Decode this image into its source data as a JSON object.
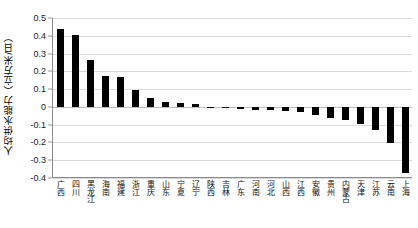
{
  "chart_data": {
    "type": "bar",
    "title": "",
    "subtitle": "",
    "xlabel": "",
    "ylabel": "人均供水能力（立方米/日）",
    "ylim": [
      -0.4,
      0.5
    ],
    "ytick_labels": [
      "0.5",
      "0.4",
      "0.3",
      "0.2",
      "0.1",
      "0",
      "-0.1",
      "-0.2",
      "-0.3",
      "-0.4"
    ],
    "ytick_values": [
      0.5,
      0.4,
      0.3,
      0.2,
      0.1,
      0,
      -0.1,
      -0.2,
      -0.3,
      -0.4
    ],
    "grid": true,
    "legend": false,
    "legend_position": "none",
    "bar_color": "#000000",
    "categories": [
      "广西",
      "四川",
      "黑龙江",
      "海南",
      "福建",
      "浙江",
      "重庆",
      "山东",
      "宁夏",
      "辽宁",
      "陕西",
      "吉林",
      "广东",
      "河南",
      "河北",
      "山西",
      "江西",
      "安徽",
      "贵州",
      "内蒙古",
      "天津",
      "江苏",
      "云南",
      "上海"
    ],
    "values": [
      0.44,
      0.405,
      0.265,
      0.175,
      0.168,
      0.097,
      0.05,
      0.028,
      0.02,
      0.015,
      -0.004,
      -0.008,
      -0.012,
      -0.015,
      -0.018,
      -0.022,
      -0.03,
      -0.048,
      -0.062,
      -0.072,
      -0.095,
      -0.128,
      -0.205,
      -0.37
    ]
  }
}
